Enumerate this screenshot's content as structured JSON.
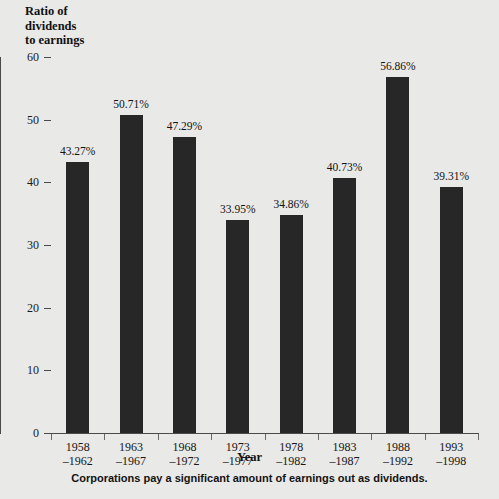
{
  "chart_data": {
    "type": "bar",
    "title": "Ratio of dividends to earnings",
    "title_lines": [
      "Ratio of",
      "dividends",
      "to earnings"
    ],
    "xlabel": "Year",
    "ylabel": "",
    "ylim": [
      0,
      60
    ],
    "yticks": [
      0,
      10,
      20,
      30,
      40,
      50,
      60
    ],
    "ytick_labels": [
      "0",
      "10",
      "20",
      "30",
      "40",
      "50",
      "60"
    ],
    "grid": false,
    "legend": "none",
    "bar_color": "#272727",
    "background_color": "#e9e9e7",
    "categories": [
      "1958–1962",
      "1963–1967",
      "1968–1972",
      "1973–1977",
      "1978–1982",
      "1983–1987",
      "1988–1992",
      "1993–1998"
    ],
    "category_lines": [
      {
        "line1": "1958",
        "line2": "–1962"
      },
      {
        "line1": "1963",
        "line2": "–1967"
      },
      {
        "line1": "1968",
        "line2": "–1972"
      },
      {
        "line1": "1973",
        "line2": "–1977"
      },
      {
        "line1": "1978",
        "line2": "–1982"
      },
      {
        "line1": "1983",
        "line2": "–1987"
      },
      {
        "line1": "1988",
        "line2": "–1992"
      },
      {
        "line1": "1993",
        "line2": "–1998"
      }
    ],
    "values": [
      43.27,
      50.71,
      47.29,
      33.95,
      34.86,
      40.73,
      56.86,
      39.31
    ],
    "value_labels": [
      "43.27%",
      "50.71%",
      "47.29%",
      "33.95%",
      "34.86%",
      "40.73%",
      "56.86%",
      "39.31%"
    ]
  },
  "caption": "Corporations pay a significant amount of earnings out as dividends."
}
